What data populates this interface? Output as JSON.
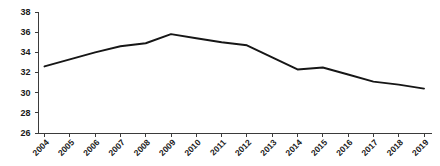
{
  "chart_data": {
    "type": "line",
    "title": "",
    "subtitle": "",
    "xlabel": "",
    "ylabel": "",
    "categories": [
      "2004",
      "2005",
      "2006",
      "2007",
      "2008",
      "2009",
      "2010",
      "2011",
      "2012",
      "2013",
      "2014",
      "2015",
      "2016",
      "2017",
      "2018",
      "2019"
    ],
    "series": [
      {
        "name": "series-1",
        "values": [
          32.6,
          33.3,
          34.0,
          34.6,
          34.9,
          35.8,
          35.4,
          35.0,
          34.7,
          33.5,
          32.3,
          32.5,
          31.8,
          31.1,
          30.8,
          30.4
        ],
        "color": "#161616"
      }
    ],
    "ylim": [
      26,
      38
    ],
    "yticks": [
      26,
      28,
      30,
      32,
      34,
      36,
      38
    ],
    "ytick_labels": [
      "26",
      "28",
      "30",
      "32",
      "34",
      "36",
      "38"
    ],
    "xtick_labels": [
      "2004",
      "2005",
      "2006",
      "2007",
      "2008",
      "2009",
      "2010",
      "2011",
      "2012",
      "2013",
      "2014",
      "2015",
      "2016",
      "2017",
      "2018",
      "2019"
    ],
    "grid": false,
    "legend": false,
    "legend_position": "none",
    "annotations": []
  },
  "style": {
    "axis_color": "#3b3b3b",
    "text_color": "#1a1a1a",
    "background": "#ffffff"
  }
}
